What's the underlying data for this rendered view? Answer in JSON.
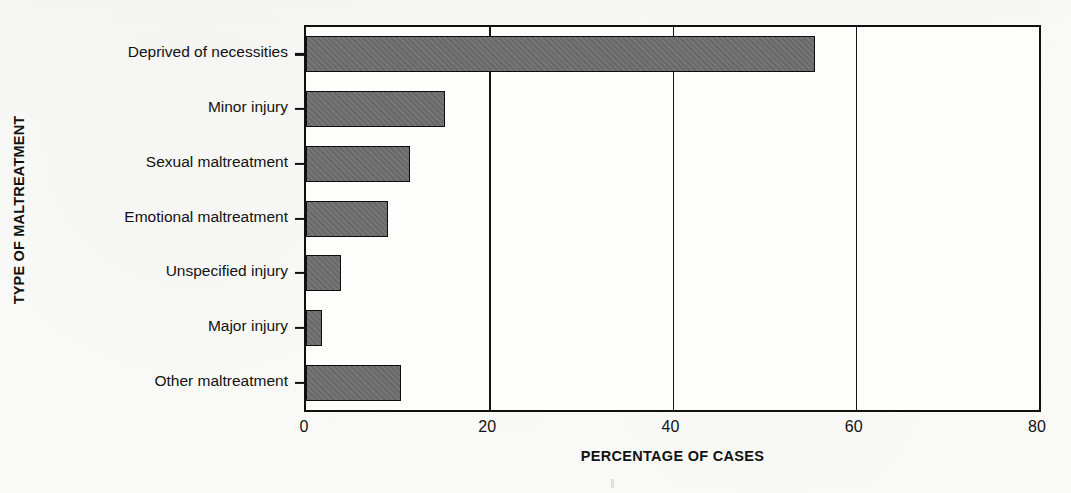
{
  "chart_data": {
    "type": "bar",
    "orientation": "horizontal",
    "title": "",
    "xlabel": "PERCENTAGE OF CASES",
    "ylabel": "TYPE OF MALTREATMENT",
    "categories": [
      "Deprived of necessities",
      "Minor injury",
      "Sexual maltreatment",
      "Emotional maltreatment",
      "Unspecified injury",
      "Major injury",
      "Other maltreatment"
    ],
    "values": [
      55.5,
      15.2,
      11.3,
      8.9,
      3.8,
      1.8,
      10.4
    ],
    "xlim": [
      0,
      80
    ],
    "xticks": [
      0,
      20,
      40,
      60,
      80
    ],
    "xtick_labels": [
      "0",
      "20",
      "40",
      "60",
      "80"
    ],
    "grid": "vertical-only",
    "legend": "none",
    "bar_fill_color": "#6e6e6e",
    "bar_edge_color": "#0d0d0d",
    "axis_color": "#101010",
    "background_color": "#fbfbf9"
  }
}
